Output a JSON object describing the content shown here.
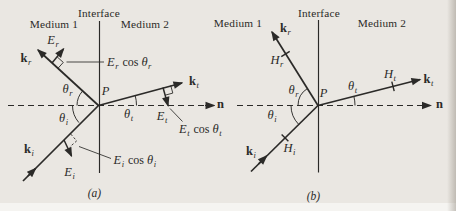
{
  "palette": {
    "ink": "#2b2a28",
    "paper": "#eae7e2"
  },
  "panels": {
    "a": {
      "caption": "(a)",
      "interface": "Interface",
      "medium_left": "Medium 1",
      "medium_right": "Medium 2",
      "point": "P",
      "normal": "n",
      "wave_vectors": {
        "reflected": {
          "base": "k",
          "sub": "r"
        },
        "incident": {
          "base": "k",
          "sub": "i"
        },
        "transmitted": {
          "base": "k",
          "sub": "t"
        }
      },
      "field_vectors": {
        "reflected": {
          "base": "E",
          "sub": "r"
        },
        "incident": {
          "base": "E",
          "sub": "i"
        },
        "transmitted": {
          "base": "E",
          "sub": "t"
        }
      },
      "angles": {
        "reflected": {
          "base": "θ",
          "sub": "r"
        },
        "incident": {
          "base": "θ",
          "sub": "i"
        },
        "transmitted": {
          "base": "θ",
          "sub": "t"
        }
      },
      "projections": {
        "reflected": {
          "vec": "E",
          "vecsub": "r",
          "op": "cos",
          "ang": "θ",
          "angsub": "r"
        },
        "incident": {
          "vec": "E",
          "vecsub": "i",
          "op": "cos",
          "ang": "θ",
          "angsub": "i"
        },
        "transmitted": {
          "vec": "E",
          "vecsub": "t",
          "op": "cos",
          "ang": "θ",
          "angsub": "t"
        }
      }
    },
    "b": {
      "caption": "(b)",
      "interface": "Interface",
      "medium_left": "Medium 1",
      "medium_right": "Medium 2",
      "point": "P",
      "normal": "n",
      "wave_vectors": {
        "reflected": {
          "base": "k",
          "sub": "r"
        },
        "incident": {
          "base": "k",
          "sub": "i"
        },
        "transmitted": {
          "base": "k",
          "sub": "t"
        }
      },
      "field_vectors": {
        "reflected": {
          "base": "H",
          "sub": "r"
        },
        "incident": {
          "base": "H",
          "sub": "i"
        },
        "transmitted": {
          "base": "H",
          "sub": "t"
        }
      },
      "angles": {
        "reflected": {
          "base": "θ",
          "sub": "r"
        },
        "incident": {
          "base": "θ",
          "sub": "i"
        },
        "transmitted": {
          "base": "θ",
          "sub": "t"
        }
      }
    }
  }
}
